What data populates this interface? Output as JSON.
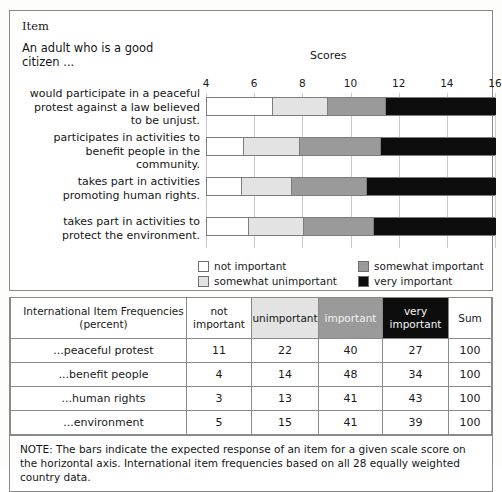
{
  "panel": {
    "item_heading": "Item",
    "stem": "An adult who is a good citizen ...",
    "scores_label": "Scores"
  },
  "legend": [
    {
      "key": "not_important",
      "label": "not important",
      "color": "#ffffff"
    },
    {
      "key": "somewhat_unimportant",
      "label": "somewhat unimportant",
      "color": "#e3e3e3"
    },
    {
      "key": "somewhat_important",
      "label": "somewhat important",
      "color": "#9a9a9a"
    },
    {
      "key": "very_important",
      "label": "very important",
      "color": "#0d0d0d"
    }
  ],
  "chart_data": {
    "type": "bar",
    "orientation": "horizontal",
    "stacked": true,
    "title": "Scores",
    "xlabel": "Scores",
    "ylabel": "",
    "xlim": [
      4,
      16
    ],
    "xticks": [
      4,
      6,
      8,
      10,
      12,
      14,
      16
    ],
    "xtick_labels": [
      "4",
      "6",
      "8",
      "10",
      "12",
      "14",
      "16"
    ],
    "grid": true,
    "legend_position": "bottom",
    "categories": [
      "would participate in a peaceful protest against a law believed to be unjust.",
      "participates in activities to benefit people in the community.",
      "takes part in activities promoting human rights.",
      "takes part in activities to protect the environment."
    ],
    "series": [
      {
        "name": "not important",
        "color": "#ffffff",
        "boundaries": [
          6.7,
          5.5,
          5.4,
          5.7
        ]
      },
      {
        "name": "somewhat unimportant",
        "color": "#e3e3e3",
        "boundaries": [
          9.0,
          7.8,
          7.5,
          8.0
        ]
      },
      {
        "name": "somewhat important",
        "color": "#9a9a9a",
        "boundaries": [
          11.4,
          11.2,
          10.6,
          10.9
        ]
      },
      {
        "name": "very important",
        "color": "#0d0d0d",
        "boundaries": [
          16,
          16,
          16,
          16
        ]
      }
    ],
    "bars": [
      {
        "label": "would participate in a peaceful protest against a law believed to be unjust.",
        "thresholds": [
          6.7,
          9.0,
          11.4
        ],
        "start": 4,
        "end": 16
      },
      {
        "label": "participates in activities to benefit people in the community.",
        "thresholds": [
          5.5,
          7.8,
          11.2
        ],
        "start": 4,
        "end": 16
      },
      {
        "label": "takes part in activities promoting human rights.",
        "thresholds": [
          5.4,
          7.5,
          10.6
        ],
        "start": 4,
        "end": 16
      },
      {
        "label": "takes part in activities to protect the environment.",
        "thresholds": [
          5.7,
          8.0,
          10.9
        ],
        "start": 4,
        "end": 16
      }
    ]
  },
  "row_labels": [
    "would participate in a peaceful protest against a law believed to be unjust.",
    "participates in activities to benefit people in the community.",
    "takes part in activities promoting human rights.",
    "takes part in activities to protect the environment."
  ],
  "table": {
    "corner_header": "International Item Frequencies (percent)",
    "headers": [
      "not important",
      "unimportant",
      "important",
      "very important",
      "Sum"
    ],
    "rows": [
      {
        "name": "...peaceful protest",
        "values": [
          "11",
          "22",
          "40",
          "27",
          "100"
        ]
      },
      {
        "name": "...benefit people",
        "values": [
          "4",
          "14",
          "48",
          "34",
          "100"
        ]
      },
      {
        "name": "...human rights",
        "values": [
          "3",
          "13",
          "41",
          "43",
          "100"
        ]
      },
      {
        "name": "...environment",
        "values": [
          "5",
          "15",
          "41",
          "39",
          "100"
        ]
      }
    ]
  },
  "note": "NOTE: The bars indicate the expected response of an item for a given scale score on the horizontal axis. International item frequencies based on all 28 equally weighted country data."
}
